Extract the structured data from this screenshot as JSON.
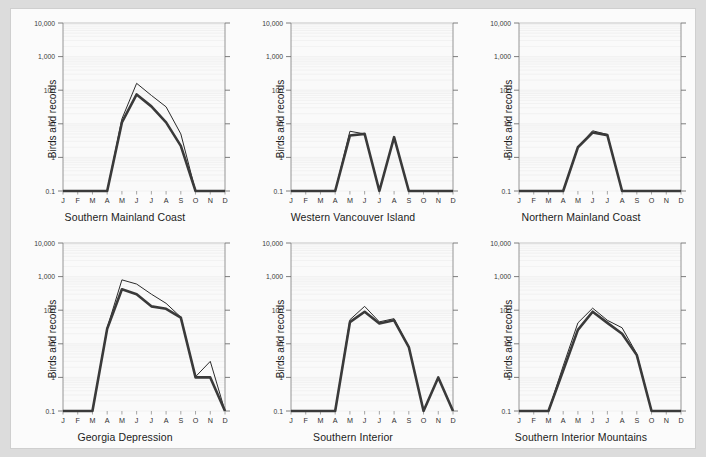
{
  "figure": {
    "y_axis_label": "Birds and records",
    "page_background": "#dcdcdc",
    "panel_background": "#fbfbfb",
    "line_color_thin": "#2b2b2b",
    "line_color_thick": "#3a3a3a"
  },
  "axes": {
    "x_ticks": [
      "J",
      "F",
      "M",
      "A",
      "M",
      "J",
      "J",
      "A",
      "S",
      "O",
      "N",
      "D"
    ],
    "y_ticks": [
      "10,000",
      "1,000",
      "100",
      "10",
      "1",
      "0.1"
    ],
    "y_tick_values": [
      10000,
      1000,
      100,
      10,
      1,
      0.1
    ],
    "scale": "log",
    "ylim": [
      0.1,
      10000
    ]
  },
  "chart_data": [
    {
      "type": "line",
      "title": "Southern Mainland Coast",
      "xlabel": "",
      "ylabel": "Birds and records",
      "categories": [
        "J",
        "F",
        "M",
        "A",
        "M",
        "J",
        "J",
        "A",
        "S",
        "O",
        "N",
        "D"
      ],
      "ylim": [
        0.1,
        10000
      ],
      "yscale": "log",
      "grid": true,
      "legend": "none",
      "series": [
        {
          "name": "records",
          "width": "thin",
          "values": [
            0.1,
            0.1,
            0.1,
            0.1,
            14,
            160,
            70,
            32,
            5,
            0.1,
            0.1,
            0.1
          ]
        },
        {
          "name": "birds",
          "width": "thick",
          "values": [
            0.1,
            0.1,
            0.1,
            0.1,
            11,
            75,
            33,
            11,
            2.2,
            0.1,
            0.1,
            0.1
          ]
        }
      ]
    },
    {
      "type": "line",
      "title": "Western Vancouver Island",
      "xlabel": "",
      "ylabel": "Birds and records",
      "categories": [
        "J",
        "F",
        "M",
        "A",
        "M",
        "J",
        "J",
        "A",
        "S",
        "O",
        "N",
        "D"
      ],
      "ylim": [
        0.1,
        10000
      ],
      "yscale": "log",
      "grid": true,
      "legend": "none",
      "series": [
        {
          "name": "records",
          "width": "thin",
          "values": [
            0.1,
            0.1,
            0.1,
            0.1,
            6,
            5,
            0.1,
            4,
            0.1,
            0.1,
            0.1,
            0.1
          ]
        },
        {
          "name": "birds",
          "width": "thick",
          "values": [
            0.1,
            0.1,
            0.1,
            0.1,
            4.5,
            5,
            0.1,
            4,
            0.1,
            0.1,
            0.1,
            0.1
          ]
        }
      ]
    },
    {
      "type": "line",
      "title": "Northern Mainland Coast",
      "xlabel": "",
      "ylabel": "Birds and records",
      "categories": [
        "J",
        "F",
        "M",
        "A",
        "M",
        "J",
        "J",
        "A",
        "S",
        "O",
        "N",
        "D"
      ],
      "ylim": [
        0.1,
        10000
      ],
      "yscale": "log",
      "grid": true,
      "legend": "none",
      "series": [
        {
          "name": "records",
          "width": "thin",
          "values": [
            0.1,
            0.1,
            0.1,
            0.1,
            2,
            6.2,
            4.8,
            0.1,
            0.1,
            0.1,
            0.1,
            0.1
          ]
        },
        {
          "name": "birds",
          "width": "thick",
          "values": [
            0.1,
            0.1,
            0.1,
            0.1,
            2,
            5.5,
            4.6,
            0.1,
            0.1,
            0.1,
            0.1,
            0.1
          ]
        }
      ]
    },
    {
      "type": "line",
      "title": "Georgia Depression",
      "xlabel": "",
      "ylabel": "Birds and records",
      "categories": [
        "J",
        "F",
        "M",
        "A",
        "M",
        "J",
        "J",
        "A",
        "S",
        "O",
        "N",
        "D"
      ],
      "ylim": [
        0.1,
        10000
      ],
      "yscale": "log",
      "grid": true,
      "legend": "none",
      "series": [
        {
          "name": "records",
          "width": "thin",
          "values": [
            0.1,
            0.1,
            0.1,
            30,
            800,
            600,
            300,
            160,
            62,
            1.05,
            3,
            0.1
          ]
        },
        {
          "name": "birds",
          "width": "thick",
          "values": [
            0.1,
            0.1,
            0.1,
            28,
            420,
            300,
            130,
            110,
            60,
            1.0,
            1.0,
            0.1
          ]
        }
      ]
    },
    {
      "type": "line",
      "title": "Southern Interior",
      "xlabel": "",
      "ylabel": "Birds and records",
      "categories": [
        "J",
        "F",
        "M",
        "A",
        "M",
        "J",
        "J",
        "A",
        "S",
        "O",
        "N",
        "D"
      ],
      "ylim": [
        0.1,
        10000
      ],
      "yscale": "log",
      "grid": true,
      "legend": "none",
      "series": [
        {
          "name": "records",
          "width": "thin",
          "values": [
            0.1,
            0.1,
            0.1,
            0.1,
            52,
            130,
            45,
            56,
            8,
            0.1,
            1.0,
            0.1
          ]
        },
        {
          "name": "birds",
          "width": "thick",
          "values": [
            0.1,
            0.1,
            0.1,
            0.1,
            44,
            90,
            40,
            50,
            8,
            0.1,
            1.0,
            0.1
          ]
        }
      ]
    },
    {
      "type": "line",
      "title": "Southern Interior Mountains",
      "xlabel": "",
      "ylabel": "Birds and records",
      "categories": [
        "J",
        "F",
        "M",
        "A",
        "M",
        "J",
        "J",
        "A",
        "S",
        "O",
        "N",
        "D"
      ],
      "ylim": [
        0.1,
        10000
      ],
      "yscale": "log",
      "grid": true,
      "legend": "none",
      "series": [
        {
          "name": "records",
          "width": "thin",
          "values": [
            0.1,
            0.1,
            0.1,
            2.2,
            42,
            115,
            50,
            30,
            5,
            0.1,
            0.1,
            0.1
          ]
        },
        {
          "name": "birds",
          "width": "thick",
          "values": [
            0.1,
            0.1,
            0.1,
            1.6,
            26,
            90,
            42,
            20,
            4.6,
            0.1,
            0.1,
            0.1
          ]
        }
      ]
    }
  ]
}
